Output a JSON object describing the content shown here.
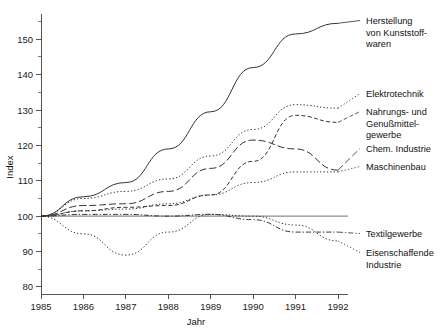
{
  "chart_data": {
    "type": "line",
    "title": "",
    "xlabel": "Jahr",
    "ylabel": "Index",
    "x": [
      1985,
      1986,
      1987,
      1988,
      1989,
      1990,
      1991,
      1992
    ],
    "categories": [
      "1985",
      "1986",
      "1987",
      "1988",
      "1989",
      "1990",
      "1991",
      "1992"
    ],
    "xlim": [
      1985,
      1992
    ],
    "ylim": [
      78,
      156
    ],
    "grid": false,
    "legend_position": "right-outside-labels",
    "y_ticks_major": [
      80,
      90,
      100,
      110,
      120,
      130,
      140,
      150
    ],
    "y_tick_labels": [
      "80",
      "90",
      "100",
      "110",
      "120",
      "130",
      "140",
      "150"
    ],
    "y_ticks_minor": [
      85,
      95,
      105,
      115,
      125,
      135,
      145,
      155
    ],
    "reference_line": 100,
    "series": [
      {
        "name": "Herstellung von Kunststoffwaren",
        "label_lines": [
          "Herstellung",
          "von Kunststoff-",
          "waren"
        ],
        "dash": "solid",
        "color": "#3a3a3a",
        "values": [
          100.0,
          105.5,
          109.5,
          119.0,
          129.5,
          142.0,
          151.5,
          154.5
        ]
      },
      {
        "name": "Elektrotechnik",
        "label_lines": [
          "Elektrotechnik"
        ],
        "dash": "dotted",
        "color": "#8a8a8a",
        "values": [
          100.0,
          105.0,
          107.0,
          110.5,
          117.0,
          124.5,
          131.5,
          130.5
        ]
      },
      {
        "name": "Nahrungs- und Genußmittelgewerbe",
        "label_lines": [
          "Nahrungs- und",
          "Genußmittel-",
          "gewerbe"
        ],
        "dash": "dashed",
        "color": "#3a3a3a",
        "values": [
          100.0,
          101.5,
          102.5,
          103.0,
          106.0,
          115.5,
          128.5,
          126.5
        ]
      },
      {
        "name": "Chem. Industrie",
        "label_lines": [
          "Chem. Industrie"
        ],
        "dash": "longdash",
        "color": "#3a3a3a",
        "values": [
          100.0,
          103.0,
          103.5,
          107.0,
          113.5,
          121.5,
          119.0,
          113.0
        ]
      },
      {
        "name": "Maschinenbau",
        "label_lines": [
          "Maschinenbau"
        ],
        "dash": "dotted",
        "color": "#9a9a9a",
        "values": [
          100.0,
          101.5,
          102.0,
          103.5,
          106.0,
          109.5,
          112.5,
          112.5
        ]
      },
      {
        "name": "Textilgewerbe",
        "label_lines": [
          "Textilgewerbe"
        ],
        "dash": "dashdot",
        "color": "#6a6a6a",
        "values": [
          100.0,
          100.5,
          100.5,
          100.0,
          100.5,
          99.0,
          95.5,
          95.5
        ]
      },
      {
        "name": "Eisenschaffende Industrie",
        "label_lines": [
          "Eisenschaffende",
          "Industrie"
        ],
        "dash": "dotted",
        "color": "#7a7a7a",
        "values": [
          100.0,
          95.0,
          89.0,
          95.5,
          100.5,
          100.0,
          97.5,
          93.0
        ]
      }
    ],
    "annotations": []
  },
  "legend_labels": {
    "kunststoff": [
      "Herstellung",
      "von Kunststoff-",
      "waren"
    ],
    "elektrotechnik": [
      "Elektrotechnik"
    ],
    "nahrungs": [
      "Nahrungs- und",
      "Genußmittel-",
      "gewerbe"
    ],
    "chemie": [
      "Chem. Industrie"
    ],
    "maschinenbau": [
      "Maschinenbau"
    ],
    "textil": [
      "Textilgewerbe"
    ],
    "eisen": [
      "Eisenschaffende",
      "Industrie"
    ]
  },
  "axes": {
    "y_label": "Index",
    "x_label": "Jahr",
    "y_tick_labels": [
      "150",
      "140",
      "130",
      "120",
      "110",
      "100",
      "90",
      "80"
    ],
    "x_tick_labels": [
      "1985",
      "1986",
      "1987",
      "1988",
      "1989",
      "1990",
      "1991",
      "1992"
    ]
  },
  "colors": {
    "axis": "#555555",
    "text": "#111111",
    "series_dark": "#3a3a3a",
    "series_light": "#9a9a9a"
  }
}
